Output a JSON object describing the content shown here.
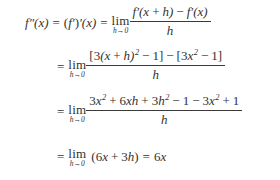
{
  "document": {
    "kind": "math-derivation",
    "background_color": "#ffffff",
    "text_color": "#33322f",
    "rule_color": "#3a3a38"
  },
  "symbols": {
    "equals": "=",
    "plus": "+",
    "minus": "−",
    "lim": "lim",
    "limit_variable": "h",
    "limit_arrow": "→",
    "limit_target": "0",
    "open_paren": "(",
    "close_paren": ")",
    "open_bracket": "[",
    "close_bracket": "]",
    "prime": "′",
    "double_prime": "″",
    "exponent_two": "2"
  },
  "lines": [
    {
      "id": "line-1",
      "lhs": "f",
      "lhs_primes": "″",
      "lhs_arg": "(x)",
      "equals": "=",
      "mid_open": "(",
      "mid_f": "f",
      "mid_prime_inner": "′",
      "mid_close": ")",
      "mid_prime_outer": "′",
      "mid_arg": "(x)",
      "equals2": "=",
      "limit": {
        "word": "lim",
        "variable": "h",
        "arrow": "→",
        "target": "0"
      },
      "fraction": {
        "numerator_parts": [
          "f",
          "′",
          "(x",
          "+",
          "h)",
          "−",
          "f",
          "′",
          "(x)"
        ],
        "numerator_text": "f′(x + h) − f′(x)",
        "denominator": "h"
      }
    },
    {
      "id": "line-2",
      "lead_equals": "=",
      "limit": {
        "word": "lim",
        "variable": "h",
        "arrow": "→",
        "target": "0"
      },
      "fraction": {
        "numerator_text": "[3(x + h)² − 1] − [3x² − 1]",
        "denominator": "h"
      }
    },
    {
      "id": "line-3",
      "lead_equals": "=",
      "limit": {
        "word": "lim",
        "variable": "h",
        "arrow": "→",
        "target": "0"
      },
      "fraction": {
        "numerator_text": "3x² + 6xh + 3h² − 1 − 3x² + 1",
        "denominator": "h"
      }
    },
    {
      "id": "line-4",
      "lead_equals": "=",
      "limit": {
        "word": "lim",
        "variable": "h",
        "arrow": "→",
        "target": "0"
      },
      "expression": "(6x + 3h)",
      "final_equals": "=",
      "result": "6x"
    }
  ],
  "tokens": {
    "f": "f",
    "x": "x",
    "h": "h",
    "three": "3",
    "six": "6",
    "one": "1",
    "two": "2",
    "six_x": "6x",
    "three_x": "3x",
    "six_xh": "6xh",
    "three_h": "3h",
    "open_x": "(x",
    "close_x": "x)",
    "x_close": "(x)",
    "h_close": "h)"
  }
}
